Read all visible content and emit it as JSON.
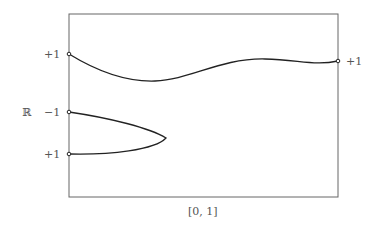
{
  "diagram": {
    "space_label": "ℝ",
    "interval_label": "[0, 1]",
    "left_labels": [
      {
        "text": "+1",
        "y": 54
      },
      {
        "text": "−1",
        "y": 112
      },
      {
        "text": "+1",
        "y": 154
      }
    ],
    "right_labels": [
      {
        "text": "+1",
        "y": 61
      }
    ],
    "frame": {
      "x": 69,
      "y": 14,
      "width": 269,
      "height": 183
    },
    "colors": {
      "frame": "#666666",
      "curve": "#222222",
      "text": "#555555"
    }
  }
}
